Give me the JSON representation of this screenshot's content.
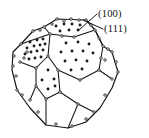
{
  "figure": {
    "kind": "crystal-polyhedron-facet-diagram",
    "background_color": "#ffffff",
    "line_color": "#141414",
    "dot_fill_color": "#1a1a1a",
    "vertex_marker_fill": "#ffffff",
    "vertex_marker_stroke": "#141414"
  },
  "labels": [
    {
      "id": "label-100",
      "text": "(100)",
      "x": 98,
      "y": 9
    },
    {
      "id": "label-111",
      "text": "(111)",
      "x": 104,
      "y": 24
    }
  ],
  "leader_lines": [
    {
      "name": "leader-100",
      "from": [
        97,
        14
      ],
      "to": [
        79,
        30
      ]
    },
    {
      "name": "leader-111",
      "from": [
        103,
        29
      ],
      "to": [
        83,
        20
      ]
    }
  ],
  "faces": [
    {
      "name": "top-face-100",
      "facet_index": "(100)",
      "type": "square",
      "polygon": [
        [
          44,
          27
        ],
        [
          57,
          19
        ],
        [
          86,
          20
        ],
        [
          95,
          30
        ],
        [
          74,
          37
        ],
        [
          50,
          34
        ]
      ],
      "dot_count": 7,
      "dots": [
        [
          56,
          26
        ],
        [
          64,
          24
        ],
        [
          72,
          24
        ],
        [
          80,
          25
        ],
        [
          60,
          31
        ],
        [
          69,
          30
        ],
        [
          78,
          30
        ]
      ]
    },
    {
      "name": "upper-left-face-111",
      "facet_index": "(111)",
      "type": "hexagon",
      "polygon": [
        [
          21,
          44
        ],
        [
          33,
          31
        ],
        [
          44,
          27
        ],
        [
          50,
          34
        ],
        [
          48,
          56
        ],
        [
          36,
          68
        ],
        [
          20,
          62
        ]
      ],
      "dot_count": 14,
      "dots": [
        [
          30,
          42
        ],
        [
          37,
          40
        ],
        [
          43,
          39
        ],
        [
          27,
          48
        ],
        [
          34,
          46
        ],
        [
          40,
          45
        ],
        [
          45,
          44
        ],
        [
          25,
          54
        ],
        [
          31,
          52
        ],
        [
          37,
          51
        ],
        [
          43,
          50
        ],
        [
          29,
          59
        ],
        [
          35,
          58
        ],
        [
          41,
          57
        ]
      ]
    },
    {
      "name": "right-face-111",
      "facet_index": "(111)",
      "type": "hexagon",
      "polygon": [
        [
          50,
          34
        ],
        [
          74,
          37
        ],
        [
          95,
          30
        ],
        [
          103,
          46
        ],
        [
          99,
          70
        ],
        [
          80,
          80
        ],
        [
          58,
          70
        ],
        [
          48,
          56
        ]
      ],
      "dot_count": 12,
      "dots": [
        [
          66,
          43
        ],
        [
          78,
          42
        ],
        [
          89,
          44
        ],
        [
          61,
          52
        ],
        [
          72,
          51
        ],
        [
          83,
          51
        ],
        [
          93,
          53
        ],
        [
          65,
          61
        ],
        [
          76,
          60
        ],
        [
          87,
          61
        ],
        [
          71,
          70
        ],
        [
          82,
          69
        ]
      ]
    },
    {
      "name": "bottom-center-face-100",
      "facet_index": "(100)",
      "type": "square",
      "polygon": [
        [
          36,
          68
        ],
        [
          48,
          56
        ],
        [
          58,
          70
        ],
        [
          60,
          92
        ],
        [
          46,
          99
        ],
        [
          36,
          86
        ]
      ],
      "dot_count": 5,
      "dots": [
        [
          48,
          70
        ],
        [
          42,
          80
        ],
        [
          54,
          79
        ],
        [
          48,
          89
        ],
        [
          55,
          86
        ]
      ]
    },
    {
      "name": "lower-left-face-100",
      "facet_index": "(100)",
      "type": "square",
      "polygon": [
        [
          13,
          66
        ],
        [
          20,
          62
        ],
        [
          36,
          68
        ],
        [
          36,
          86
        ],
        [
          30,
          100
        ],
        [
          14,
          84
        ]
      ],
      "dot_count": 0,
      "dots": []
    },
    {
      "name": "lower-right-face-111",
      "facet_index": "(111)",
      "type": "hexagon",
      "polygon": [
        [
          80,
          80
        ],
        [
          99,
          70
        ],
        [
          112,
          79
        ],
        [
          109,
          101
        ],
        [
          94,
          112
        ],
        [
          78,
          104
        ],
        [
          60,
          92
        ],
        [
          58,
          70
        ]
      ],
      "dot_count": 0,
      "dots": []
    },
    {
      "name": "bottom-front-face-100",
      "facet_index": "(100)",
      "type": "square",
      "polygon": [
        [
          30,
          100
        ],
        [
          46,
          99
        ],
        [
          60,
          92
        ],
        [
          78,
          104
        ],
        [
          68,
          128
        ],
        [
          46,
          125
        ]
      ],
      "dot_count": 0,
      "dots": []
    },
    {
      "name": "far-right-face-111",
      "facet_index": "(111)",
      "type": "hexagon",
      "polygon": [
        [
          103,
          46
        ],
        [
          112,
          52
        ],
        [
          118,
          70
        ],
        [
          112,
          79
        ],
        [
          99,
          70
        ]
      ],
      "dot_count": 0,
      "dots": []
    }
  ],
  "outline": {
    "name": "polyhedron-silhouette",
    "points": [
      [
        44,
        27
      ],
      [
        57,
        19
      ],
      [
        86,
        20
      ],
      [
        95,
        30
      ],
      [
        103,
        46
      ],
      [
        112,
        52
      ],
      [
        118,
        72
      ],
      [
        112,
        88
      ],
      [
        100,
        108
      ],
      [
        86,
        122
      ],
      [
        68,
        128
      ],
      [
        46,
        125
      ],
      [
        30,
        108
      ],
      [
        17,
        90
      ],
      [
        12,
        70
      ],
      [
        13,
        52
      ],
      [
        21,
        44
      ],
      [
        33,
        31
      ]
    ]
  },
  "internal_edges": [
    [
      [
        44,
        27
      ],
      [
        50,
        34
      ]
    ],
    [
      [
        50,
        34
      ],
      [
        74,
        37
      ]
    ],
    [
      [
        74,
        37
      ],
      [
        95,
        30
      ]
    ],
    [
      [
        50,
        34
      ],
      [
        48,
        56
      ]
    ],
    [
      [
        48,
        56
      ],
      [
        58,
        70
      ]
    ],
    [
      [
        58,
        70
      ],
      [
        80,
        80
      ]
    ],
    [
      [
        80,
        80
      ],
      [
        99,
        70
      ]
    ],
    [
      [
        99,
        70
      ],
      [
        103,
        46
      ]
    ],
    [
      [
        103,
        46
      ],
      [
        95,
        30
      ]
    ],
    [
      [
        21,
        44
      ],
      [
        50,
        34
      ]
    ],
    [
      [
        20,
        62
      ],
      [
        36,
        68
      ]
    ],
    [
      [
        36,
        68
      ],
      [
        48,
        56
      ]
    ],
    [
      [
        36,
        68
      ],
      [
        36,
        86
      ]
    ],
    [
      [
        36,
        86
      ],
      [
        30,
        100
      ]
    ],
    [
      [
        36,
        86
      ],
      [
        46,
        99
      ]
    ],
    [
      [
        46,
        99
      ],
      [
        60,
        92
      ]
    ],
    [
      [
        60,
        92
      ],
      [
        58,
        70
      ]
    ],
    [
      [
        60,
        92
      ],
      [
        78,
        104
      ]
    ],
    [
      [
        78,
        104
      ],
      [
        94,
        112
      ]
    ],
    [
      [
        99,
        70
      ],
      [
        112,
        79
      ]
    ],
    [
      [
        46,
        99
      ],
      [
        46,
        125
      ]
    ],
    [
      [
        78,
        104
      ],
      [
        68,
        128
      ]
    ]
  ],
  "vertex_markers": [
    [
      44,
      27
    ],
    [
      57,
      19
    ],
    [
      71,
      19
    ],
    [
      86,
      20
    ],
    [
      95,
      30
    ],
    [
      103,
      46
    ],
    [
      112,
      52
    ],
    [
      118,
      72
    ],
    [
      21,
      44
    ],
    [
      33,
      31
    ],
    [
      50,
      34
    ],
    [
      62,
      36
    ],
    [
      74,
      37
    ],
    [
      48,
      56
    ],
    [
      20,
      62
    ],
    [
      13,
      66
    ],
    [
      36,
      68
    ],
    [
      58,
      70
    ],
    [
      80,
      80
    ],
    [
      99,
      70
    ],
    [
      36,
      86
    ],
    [
      30,
      100
    ],
    [
      46,
      99
    ],
    [
      60,
      92
    ],
    [
      78,
      104
    ],
    [
      94,
      112
    ],
    [
      112,
      79
    ],
    [
      17,
      90
    ],
    [
      27,
      52
    ],
    [
      24,
      58
    ],
    [
      105,
      60
    ],
    [
      101,
      58
    ],
    [
      40,
      30
    ],
    [
      52,
      24
    ],
    [
      64,
      21
    ],
    [
      79,
      20
    ],
    [
      91,
      25
    ],
    [
      99,
      38
    ],
    [
      108,
      49
    ],
    [
      116,
      62
    ],
    [
      14,
      56
    ],
    [
      16,
      76
    ],
    [
      22,
      95
    ],
    [
      38,
      112
    ],
    [
      56,
      124
    ],
    [
      72,
      126
    ],
    [
      86,
      119
    ],
    [
      105,
      95
    ]
  ]
}
